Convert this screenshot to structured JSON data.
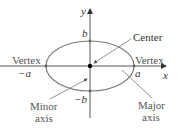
{
  "diagram": {
    "type": "ellipse-anatomy",
    "axes": {
      "x_label": "x",
      "y_label": "y"
    },
    "points": {
      "positive_a": "a",
      "negative_a": "−a",
      "positive_b": "b",
      "negative_b": "−b"
    },
    "labels": {
      "center": "Center",
      "vertex_left": "Vertex",
      "vertex_right": "Vertex",
      "minor_axis_line1": "Minor",
      "minor_axis_line2": "axis",
      "major_axis_line1": "Major",
      "major_axis_line2": "axis"
    },
    "colors": {
      "ellipse": "#7a7a7a",
      "axes": "#555555",
      "center_dot": "#000000",
      "vertex_dot": "#666666",
      "leader_lines": "#777777"
    }
  }
}
